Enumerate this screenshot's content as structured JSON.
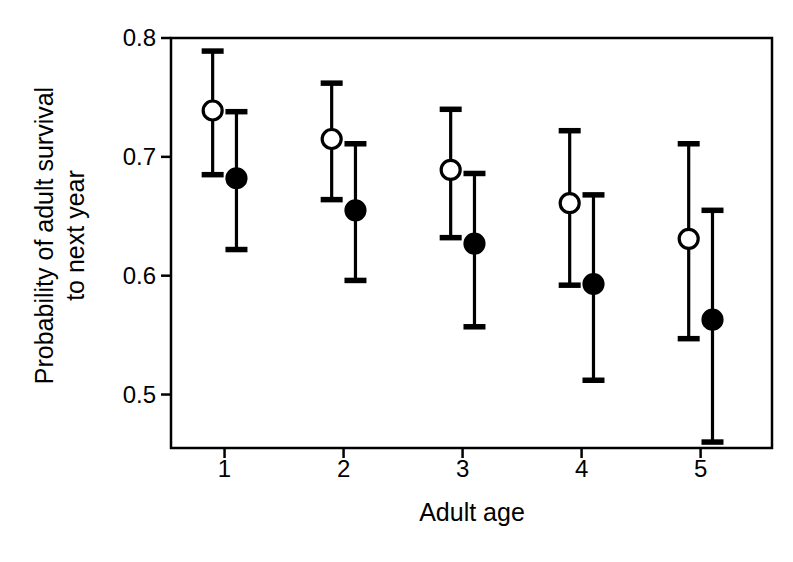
{
  "chart_data": {
    "type": "scatter",
    "title": "",
    "xlabel": "Adult age",
    "ylabel": "Probability of adult survival to next year",
    "ylabel_lines": [
      "Probability of adult survival",
      "to next year"
    ],
    "categories": [
      "1",
      "2",
      "3",
      "4",
      "5"
    ],
    "x": [
      1,
      2,
      3,
      4,
      5
    ],
    "xlim": [
      0.55,
      5.6
    ],
    "ylim": [
      0.455,
      0.8
    ],
    "xticks": [
      "1",
      "2",
      "3",
      "4",
      "5"
    ],
    "yticks": [
      "0.8",
      "0.7",
      "0.6",
      "0.5"
    ],
    "ytick_values": [
      0.8,
      0.7,
      0.6,
      0.5
    ],
    "grid": false,
    "legend": "none",
    "error_bar_style": "capped",
    "series": [
      {
        "name": "open-circle-series",
        "marker": "open-circle",
        "marker_fill": "#ffffff",
        "marker_edge": "#000000",
        "values": [
          0.739,
          0.715,
          0.689,
          0.661,
          0.631
        ],
        "err_low": [
          0.685,
          0.664,
          0.632,
          0.592,
          0.547
        ],
        "err_high": [
          0.789,
          0.762,
          0.74,
          0.722,
          0.711
        ],
        "x_offset": -0.1
      },
      {
        "name": "filled-circle-series",
        "marker": "filled-circle",
        "marker_fill": "#000000",
        "marker_edge": "#000000",
        "values": [
          0.682,
          0.655,
          0.627,
          0.593,
          0.563
        ],
        "err_low": [
          0.622,
          0.596,
          0.557,
          0.512,
          0.46
        ],
        "err_high": [
          0.738,
          0.711,
          0.686,
          0.668,
          0.655
        ],
        "x_offset": 0.1
      }
    ],
    "colors": {
      "axis": "#000000",
      "marker_open_fill": "#ffffff",
      "marker_filled_fill": "#000000",
      "background": "#ffffff"
    }
  }
}
